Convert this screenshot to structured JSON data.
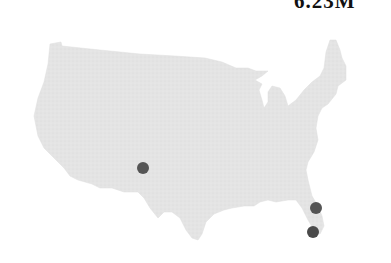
{
  "header": {
    "value_label": "6.23M",
    "value_label_note": "clipped at top edge; only lower half of glyphs visible, digits not legible"
  },
  "map": {
    "region": "contiguous-united-states",
    "fill_color": "#e4e4e4",
    "marker_color": "#555555",
    "markers": [
      {
        "name": "west-texas-marker",
        "cx": 143,
        "cy": 168,
        "r": 6
      },
      {
        "name": "north-florida-marker",
        "cx": 316,
        "cy": 208,
        "r": 6
      },
      {
        "name": "south-florida-marker",
        "cx": 313,
        "cy": 232,
        "r": 6
      }
    ]
  }
}
